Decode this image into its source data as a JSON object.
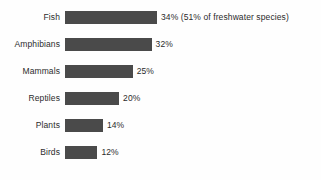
{
  "chart_data": {
    "type": "bar",
    "orientation": "horizontal",
    "title": "",
    "subtitle": "",
    "xlabel": "",
    "ylabel": "",
    "grid": false,
    "legend": false,
    "axes_visible": false,
    "xlim": [
      0,
      34
    ],
    "unit": "%",
    "bar_color": "#4a4a4a",
    "background_color": "#fefefe",
    "text_color": "#2b2b2b",
    "categories": [
      "Fish",
      "Amphibians",
      "Mammals",
      "Reptiles",
      "Plants",
      "Birds"
    ],
    "values": [
      34,
      32,
      25,
      20,
      14,
      12
    ],
    "rows": [
      {
        "category": "Fish",
        "value": 34,
        "value_label": "34%",
        "annotation": " (51% of freshwater species)",
        "full_label": "34% (51% of freshwater species)",
        "bar_pct": 100
      },
      {
        "category": "Amphibians",
        "value": 32,
        "value_label": "32%",
        "annotation": "",
        "full_label": "32%",
        "bar_pct": 94.1
      },
      {
        "category": "Mammals",
        "value": 25,
        "value_label": "25%",
        "annotation": "",
        "full_label": "25%",
        "bar_pct": 73.5
      },
      {
        "category": "Reptiles",
        "value": 20,
        "value_label": "20%",
        "annotation": "",
        "full_label": "20%",
        "bar_pct": 58.8
      },
      {
        "category": "Plants",
        "value": 14,
        "value_label": "14%",
        "annotation": "",
        "full_label": "14%",
        "bar_pct": 41.2
      },
      {
        "category": "Birds",
        "value": 12,
        "value_label": "12%",
        "annotation": "",
        "full_label": "12%",
        "bar_pct": 35.3
      }
    ]
  }
}
